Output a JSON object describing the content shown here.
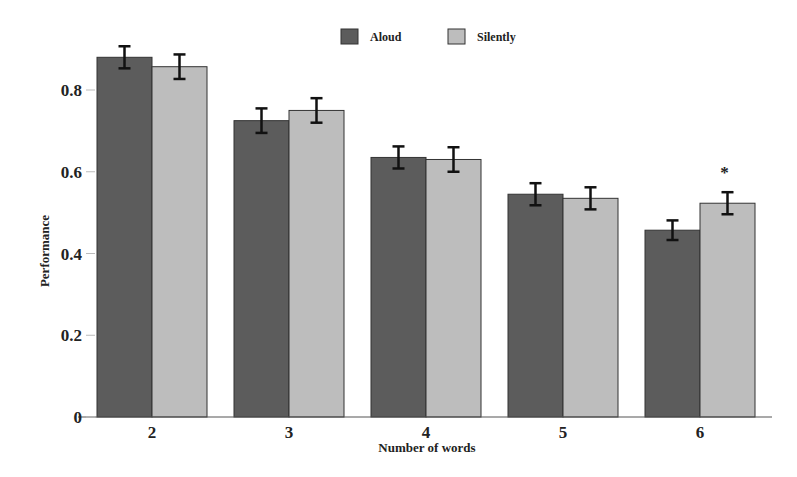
{
  "chart_data": {
    "type": "bar",
    "title": "",
    "xlabel": "Number of words",
    "ylabel": "Performance",
    "categories": [
      "2",
      "3",
      "4",
      "5",
      "6"
    ],
    "series": [
      {
        "name": "Aloud",
        "color": "#5c5c5c",
        "values": [
          0.88,
          0.725,
          0.635,
          0.545,
          0.457
        ],
        "error": [
          0.027,
          0.03,
          0.027,
          0.027,
          0.024
        ]
      },
      {
        "name": "Silently",
        "color": "#bdbdbd",
        "values": [
          0.857,
          0.75,
          0.63,
          0.535,
          0.523
        ],
        "error": [
          0.03,
          0.03,
          0.03,
          0.027,
          0.027
        ]
      }
    ],
    "ylim": [
      0,
      1.0
    ],
    "yticks": [
      0,
      0.2,
      0.4,
      0.6,
      0.8
    ],
    "ytick_labels": [
      "0",
      "0.2",
      "0.4",
      "0.6",
      "0.8"
    ],
    "grid": false,
    "legend_position": "top-center",
    "annotations": [
      {
        "text": "*",
        "category": "6",
        "series": "Silently"
      }
    ]
  }
}
